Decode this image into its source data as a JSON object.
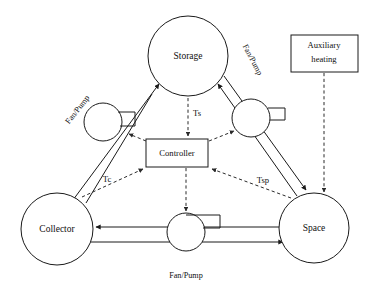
{
  "diagram": {
    "background_color": "#ffffff",
    "line_color": "#1a1a1a",
    "signal_line_color": "#2a2a2a"
  },
  "nodes": {
    "storage": {
      "label": "Storage",
      "cx": 188,
      "cy": 56,
      "r": 40
    },
    "collector": {
      "label": "Collector",
      "cx": 57,
      "cy": 229,
      "r": 36
    },
    "space": {
      "label": "Space",
      "cx": 314,
      "cy": 228,
      "r": 35
    }
  },
  "boxes": {
    "controller": {
      "label": "Controller",
      "x": 146,
      "y": 139,
      "w": 62,
      "h": 28
    },
    "auxiliary_heating": {
      "line1": "Auxiliary",
      "line2": "heating",
      "x": 291,
      "y": 35,
      "w": 67,
      "h": 37
    }
  },
  "pumps": [
    {
      "id": "pump-collector-storage",
      "label": "Fan/Pump",
      "cx": 103,
      "cy": 122,
      "r": 19,
      "label_x": 78,
      "label_y": 110,
      "label_rotation": -52
    },
    {
      "id": "pump-storage-space",
      "label": "Fan/Pump",
      "cx": 251,
      "cy": 118,
      "r": 19,
      "label_x": 252,
      "label_y": 60,
      "label_rotation": 62
    },
    {
      "id": "pump-collector-space",
      "label": "Fan/Pump",
      "cx": 186,
      "cy": 232,
      "r": 19,
      "label_x": 186,
      "label_y": 276,
      "label_rotation": 0
    }
  ],
  "signals": [
    {
      "id": "ts",
      "label": "Ts",
      "x": 196,
      "y": 114
    },
    {
      "id": "tc",
      "label": "Tc",
      "x": 107,
      "y": 180
    },
    {
      "id": "tsp",
      "label": "Tsp",
      "x": 262,
      "y": 181
    }
  ],
  "connections": [
    {
      "id": "collector-to-storage",
      "from": "Collector",
      "to": "Storage",
      "type": "flow",
      "note": "supply loop through left fan/pump"
    },
    {
      "id": "storage-to-collector",
      "from": "Storage",
      "to": "Collector",
      "type": "flow",
      "note": "return loop through left fan/pump"
    },
    {
      "id": "storage-to-space",
      "from": "Storage",
      "to": "Space",
      "type": "flow",
      "note": "supply loop through right fan/pump"
    },
    {
      "id": "space-to-storage",
      "from": "Space",
      "to": "Storage",
      "type": "flow",
      "note": "return loop through right fan/pump"
    },
    {
      "id": "space-to-collector",
      "from": "Space",
      "to": "Collector",
      "type": "flow",
      "note": "top horizontal line, arrow into Collector"
    },
    {
      "id": "collector-to-space",
      "from": "Collector",
      "to": "Space",
      "type": "flow",
      "note": "bottom horizontal line, arrow into Space"
    },
    {
      "id": "storage-to-controller",
      "from": "Storage",
      "to": "Controller",
      "type": "signal",
      "label": "Ts"
    },
    {
      "id": "collector-to-controller",
      "from": "Collector",
      "to": "Controller",
      "type": "signal",
      "label": "Tc"
    },
    {
      "id": "space-to-controller",
      "from": "Space",
      "to": "Controller",
      "type": "signal",
      "label": "Tsp"
    },
    {
      "id": "controller-to-pump-left",
      "from": "Controller",
      "to": "Fan/Pump (collector-storage)",
      "type": "signal"
    },
    {
      "id": "controller-to-pump-right",
      "from": "Controller",
      "to": "Fan/Pump (storage-space)",
      "type": "signal"
    },
    {
      "id": "controller-to-pump-bottom",
      "from": "Controller",
      "to": "Fan/Pump (collector-space)",
      "type": "signal"
    },
    {
      "id": "auxiliary-to-space",
      "from": "Auxiliary heating",
      "to": "Space",
      "type": "signal"
    }
  ]
}
